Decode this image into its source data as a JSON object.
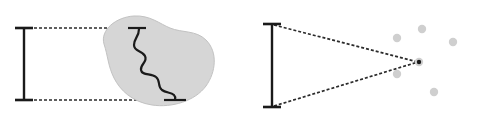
{
  "figure": {
    "title": "",
    "background": "#ffffff",
    "width": 480,
    "height": 115,
    "colors": {
      "stroke": "#1a1a1a",
      "blob_fill": "#d6d6d6",
      "blob_stroke": "#c2c2c2",
      "dot_fill": "#cfcfcf",
      "dashed": "#2b2b2b"
    },
    "panels": [
      {
        "name": "left-panel",
        "label": "",
        "scale_bar": {
          "name": "measure-bar-left",
          "x": 24,
          "y_top": 28,
          "y_bottom": 100,
          "cap_half_width": 9,
          "stroke_width": 2.4
        },
        "projection_lines": [
          {
            "name": "upper-projection-line",
            "x1": 24,
            "y1": 28,
            "x2": 145,
            "y2": 28
          },
          {
            "name": "lower-projection-line",
            "x1": 24,
            "y1": 100,
            "x2": 185,
            "y2": 100
          }
        ],
        "blob": {
          "name": "irregular-region-blob",
          "path": "M104,44 C100,30 116,17 134,16 C150,15 160,24 170,28 C182,33 196,30 206,40 C218,52 216,72 206,86 C195,101 172,108 152,105 C132,102 120,90 114,78 C108,66 108,56 104,44 Z"
        },
        "measured_curve": {
          "name": "wiggly-coastline-curve",
          "top_tick": {
            "x1": 128,
            "x2": 146,
            "y": 28
          },
          "bottom_tick": {
            "x1": 164,
            "x2": 186,
            "y": 100
          },
          "path": "M139,29 C139,37 134,38 134,45 C134,52 142,50 145,56 C148,62 140,64 141,70 C142,76 151,73 156,77 C161,81 157,86 162,90 C166,93 171,92 174,95 C176,97 175,99 175,100"
        }
      },
      {
        "name": "right-panel",
        "label": "",
        "scale_bar": {
          "name": "measure-bar-right",
          "x": 272,
          "y_top": 24,
          "y_bottom": 107,
          "cap_half_width": 9,
          "stroke_width": 2.4
        },
        "convergence_point": {
          "name": "convergence-point",
          "x": 419,
          "y": 62,
          "r": 3.4
        },
        "projection_lines": [
          {
            "name": "upper-convergence-line",
            "x1": 274,
            "y1": 25,
            "x2": 418,
            "y2": 62
          },
          {
            "name": "lower-convergence-line",
            "x1": 274,
            "y1": 106,
            "x2": 418,
            "y2": 62
          }
        ],
        "scatter_dots": [
          {
            "name": "scatter-dot",
            "x": 422,
            "y": 29,
            "r": 4.2
          },
          {
            "name": "scatter-dot",
            "x": 397,
            "y": 38,
            "r": 4.2
          },
          {
            "name": "scatter-dot",
            "x": 453,
            "y": 42,
            "r": 4.2
          },
          {
            "name": "scatter-dot",
            "x": 397,
            "y": 74,
            "r": 4.2
          },
          {
            "name": "scatter-dot",
            "x": 434,
            "y": 92,
            "r": 4.2
          }
        ]
      }
    ],
    "dash_pattern": "3,2"
  }
}
